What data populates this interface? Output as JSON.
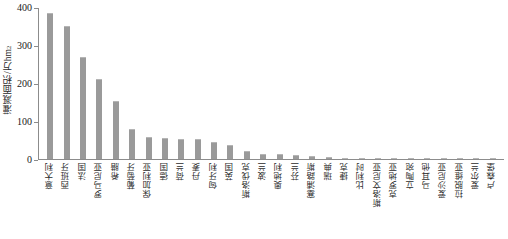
{
  "chart_data": {
    "type": "bar",
    "title": "",
    "xlabel": "",
    "ylabel": "灌溉面积/万hm²",
    "ylabel_text": "灌溉面积/万hm",
    "ylabel_sup": "2",
    "ylim": [
      0,
      400
    ],
    "yticks": [
      0,
      100,
      200,
      300,
      400
    ],
    "ytick_labels": [
      "0",
      "100",
      "200",
      "300",
      "400"
    ],
    "grid": false,
    "legend": false,
    "bar_color": "#9a9a9a",
    "axis_color": "#8c8c8c",
    "background": "#ffffff",
    "categories": [
      "意大利",
      "西班牙",
      "法国",
      "罗马尼亚",
      "希腊",
      "葡萄牙",
      "保加利亚",
      "德国",
      "荷兰",
      "丹麦",
      "匈牙利",
      "英国",
      "斯洛伐克",
      "波兰",
      "奥地利",
      "芬兰",
      "塞浦路斯",
      "瑞典",
      "捷克",
      "比利时",
      "斯洛文尼亚",
      "克罗地亚",
      "立陶宛",
      "马耳他",
      "爱沙尼亚",
      "拉脱维亚",
      "爱尔兰",
      "卢森堡"
    ],
    "values": [
      387,
      353,
      270,
      212,
      154,
      80,
      57,
      55,
      53,
      52,
      44,
      36,
      20,
      14,
      12,
      10,
      7,
      5,
      4,
      3,
      2.5,
      2,
      1.6,
      1.2,
      1,
      0.8,
      0.6,
      0.4
    ]
  }
}
